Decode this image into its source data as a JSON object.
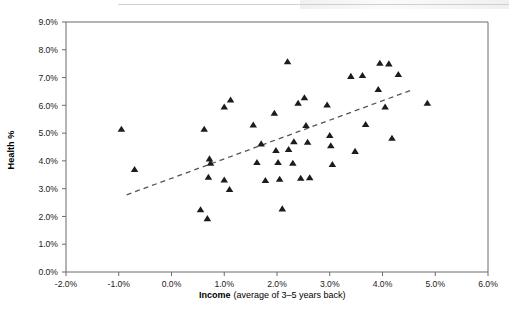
{
  "chart_data": {
    "type": "scatter",
    "title": "",
    "xlabel_bold": "Income",
    "xlabel_rest": "(average of 3–5 years back)",
    "ylabel": "Health %",
    "xlim": [
      -2.0,
      6.0
    ],
    "ylim": [
      0.0,
      9.0
    ],
    "xticks": [
      "-2.0%",
      "-1.0%",
      "0.0%",
      "1.0%",
      "2.0%",
      "3.0%",
      "4.0%",
      "5.0%",
      "6.0%"
    ],
    "xtick_values": [
      -2.0,
      -1.0,
      0.0,
      1.0,
      2.0,
      3.0,
      4.0,
      5.0,
      6.0
    ],
    "yticks": [
      "0.0%",
      "1.0%",
      "2.0%",
      "3.0%",
      "4.0%",
      "5.0%",
      "6.0%",
      "7.0%",
      "8.0%",
      "9.0%"
    ],
    "ytick_values": [
      0.0,
      1.0,
      2.0,
      3.0,
      4.0,
      5.0,
      6.0,
      7.0,
      8.0,
      9.0
    ],
    "grid": false,
    "legend": "none",
    "marker": "triangle",
    "marker_color": "#1c1c1c",
    "points": [
      {
        "x": -0.95,
        "y": 5.15
      },
      {
        "x": -0.7,
        "y": 3.7
      },
      {
        "x": 0.62,
        "y": 5.15
      },
      {
        "x": 0.55,
        "y": 2.25
      },
      {
        "x": 0.68,
        "y": 1.93
      },
      {
        "x": 0.72,
        "y": 4.08
      },
      {
        "x": 0.74,
        "y": 3.92
      },
      {
        "x": 0.7,
        "y": 3.42
      },
      {
        "x": 1.0,
        "y": 5.95
      },
      {
        "x": 1.0,
        "y": 3.32
      },
      {
        "x": 1.12,
        "y": 6.2
      },
      {
        "x": 1.1,
        "y": 2.98
      },
      {
        "x": 1.55,
        "y": 5.3
      },
      {
        "x": 1.62,
        "y": 3.95
      },
      {
        "x": 1.7,
        "y": 4.62
      },
      {
        "x": 1.78,
        "y": 3.3
      },
      {
        "x": 1.95,
        "y": 5.72
      },
      {
        "x": 1.98,
        "y": 4.38
      },
      {
        "x": 2.02,
        "y": 3.95
      },
      {
        "x": 2.05,
        "y": 3.35
      },
      {
        "x": 2.1,
        "y": 2.28
      },
      {
        "x": 2.2,
        "y": 7.58
      },
      {
        "x": 2.22,
        "y": 4.42
      },
      {
        "x": 2.3,
        "y": 3.92
      },
      {
        "x": 2.32,
        "y": 4.7
      },
      {
        "x": 2.4,
        "y": 6.08
      },
      {
        "x": 2.45,
        "y": 3.38
      },
      {
        "x": 2.52,
        "y": 6.28
      },
      {
        "x": 2.55,
        "y": 5.28
      },
      {
        "x": 2.58,
        "y": 4.68
      },
      {
        "x": 2.62,
        "y": 3.4
      },
      {
        "x": 2.95,
        "y": 6.02
      },
      {
        "x": 3.0,
        "y": 4.92
      },
      {
        "x": 3.02,
        "y": 4.55
      },
      {
        "x": 3.05,
        "y": 3.88
      },
      {
        "x": 3.4,
        "y": 7.05
      },
      {
        "x": 3.48,
        "y": 4.35
      },
      {
        "x": 3.62,
        "y": 7.08
      },
      {
        "x": 3.68,
        "y": 5.32
      },
      {
        "x": 3.92,
        "y": 6.58
      },
      {
        "x": 3.95,
        "y": 7.52
      },
      {
        "x": 4.05,
        "y": 5.95
      },
      {
        "x": 4.12,
        "y": 7.5
      },
      {
        "x": 4.18,
        "y": 4.82
      },
      {
        "x": 4.3,
        "y": 7.12
      },
      {
        "x": 4.85,
        "y": 6.08
      }
    ],
    "trendline": {
      "style": "dashed",
      "color": "#555555",
      "x_start": -0.85,
      "y_start": 2.78,
      "x_end": 4.55,
      "y_end": 6.55
    }
  }
}
